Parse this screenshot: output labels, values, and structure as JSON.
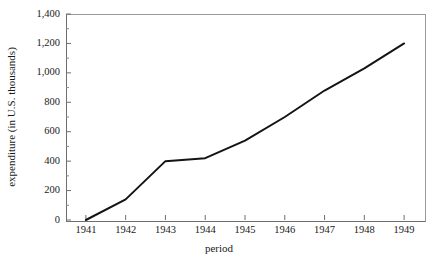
{
  "chart_data": {
    "type": "line",
    "title": "",
    "xlabel": "period",
    "ylabel": "expenditure (in U.S. thousands)",
    "categories": [
      "1941",
      "1942",
      "1943",
      "1944",
      "1945",
      "1946",
      "1947",
      "1948",
      "1949"
    ],
    "x": [
      1941,
      1942,
      1943,
      1944,
      1945,
      1946,
      1947,
      1948,
      1949
    ],
    "values": [
      0,
      140,
      400,
      420,
      540,
      700,
      880,
      1030,
      1200
    ],
    "series": [
      {
        "name": "expenditure",
        "values": [
          0,
          140,
          400,
          420,
          540,
          700,
          880,
          1030,
          1200
        ]
      }
    ],
    "xlim": [
      1940.5,
      1949.5
    ],
    "ylim": [
      0,
      1400
    ],
    "ytick_values": [
      0,
      200,
      400,
      600,
      800,
      1000,
      1200,
      1400
    ],
    "ytick_labels": [
      "0",
      "200",
      "400",
      "600",
      "800",
      "1,000",
      "1,200",
      "1,400"
    ],
    "xtick_labels": [
      "1941",
      "1942",
      "1943",
      "1944",
      "1945",
      "1946",
      "1947",
      "1948",
      "1949"
    ],
    "grid": false,
    "legend": null,
    "line_color": "#141414",
    "frame_color": "#8a8a8a",
    "background_color": "#ffffff"
  }
}
